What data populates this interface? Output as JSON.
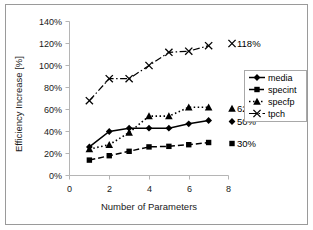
{
  "chart_data": {
    "type": "line",
    "title": "",
    "xlabel": "Number of Parameters",
    "ylabel": "Efficiency Increase [%]",
    "xlim": [
      0,
      8
    ],
    "ylim": [
      0,
      140
    ],
    "xticks": [
      "0",
      "2",
      "4",
      "6",
      "8"
    ],
    "xtick_values": [
      0,
      2,
      4,
      6,
      8
    ],
    "yticks": [
      "0%",
      "20%",
      "40%",
      "60%",
      "80%",
      "100%",
      "120%",
      "140%"
    ],
    "ytick_values": [
      0,
      20,
      40,
      60,
      80,
      100,
      120,
      140
    ],
    "grid": false,
    "legend_position": "right",
    "series": [
      {
        "name": "media",
        "marker": "diamond",
        "linestyle": "solid",
        "x": [
          1,
          2,
          3,
          4,
          5,
          6,
          7
        ],
        "values": [
          26,
          40,
          43,
          43,
          43,
          47,
          50
        ],
        "end_label": "50%"
      },
      {
        "name": "specint",
        "marker": "square",
        "linestyle": "dashed",
        "x": [
          1,
          2,
          3,
          4,
          5,
          6,
          7
        ],
        "values": [
          14,
          18,
          22,
          26,
          26.5,
          28,
          30
        ],
        "end_label": "30%"
      },
      {
        "name": "specfp",
        "marker": "triangle",
        "linestyle": "dotted",
        "x": [
          1,
          2,
          3,
          4,
          5,
          6,
          7
        ],
        "values": [
          24,
          28,
          39,
          54,
          54,
          62,
          62
        ],
        "end_label": "62%"
      },
      {
        "name": "tpch",
        "marker": "cross",
        "linestyle": "dashdot",
        "x": [
          1,
          2,
          3,
          4,
          5,
          6,
          7
        ],
        "values": [
          68,
          88,
          88,
          100,
          112,
          113,
          118
        ],
        "end_label": "118%"
      }
    ]
  },
  "legend": {
    "entries": [
      {
        "label": "media"
      },
      {
        "label": "specint"
      },
      {
        "label": "specfp"
      },
      {
        "label": "tpch"
      }
    ]
  },
  "endpoint_labels": {
    "tpch": "118%",
    "specfp": "62%",
    "media": "50%",
    "specint": "30%"
  }
}
